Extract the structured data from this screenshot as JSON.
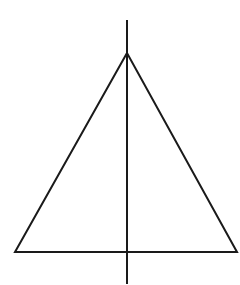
{
  "diagram": {
    "type": "isosceles-triangle-with-axis-of-symmetry",
    "background": "#ffffff",
    "stroke_color": "#1a1a1a",
    "stroke_width": 2,
    "triangle": {
      "apex": [
        127,
        53
      ],
      "base_left": [
        15,
        252
      ],
      "base_right": [
        237,
        252
      ]
    },
    "symmetry_axis": {
      "x": 127,
      "y_start": 20,
      "y_end": 284
    }
  }
}
